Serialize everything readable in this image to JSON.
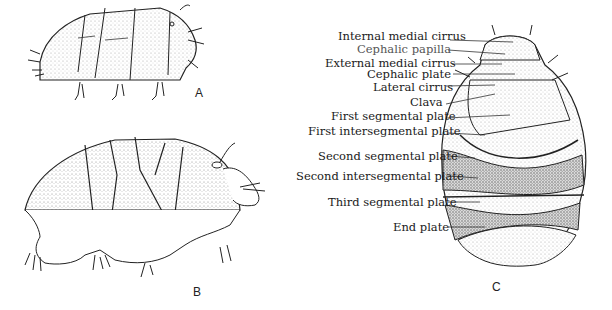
{
  "figure": {
    "panels": [
      {
        "id": "A",
        "letter": "A",
        "view": "lateral view, armored tardigrade"
      },
      {
        "id": "B",
        "letter": "B",
        "view": "lateral view, armored tardigrade with legs"
      },
      {
        "id": "C",
        "letter": "C",
        "view": "dorsal view with labeled plates"
      }
    ],
    "labels": [
      {
        "text": "Internal medial cirrus",
        "x": 338,
        "y": 4
      },
      {
        "text": "Cephalic papilla",
        "x": 357,
        "y": 18,
        "light": true
      },
      {
        "text": "External medial cirrus",
        "x": 325,
        "y": 31
      },
      {
        "text": "Cephalic plate",
        "x": 367,
        "y": 42
      },
      {
        "text": "Lateral cirrus",
        "x": 373,
        "y": 54
      },
      {
        "text": "Clava",
        "x": 410,
        "y": 68
      },
      {
        "text": "First segmental plate",
        "x": 340,
        "y": 83
      },
      {
        "text": "First intersegmental plate",
        "x": 308,
        "y": 97
      },
      {
        "text": "Second segmental plate",
        "x": 318,
        "y": 120
      },
      {
        "text": "Second intersegmental plate",
        "x": 298,
        "y": 141
      },
      {
        "text": "Third segmental plate",
        "x": 328,
        "y": 166
      },
      {
        "text": "End plate",
        "x": 393,
        "y": 190
      }
    ]
  }
}
